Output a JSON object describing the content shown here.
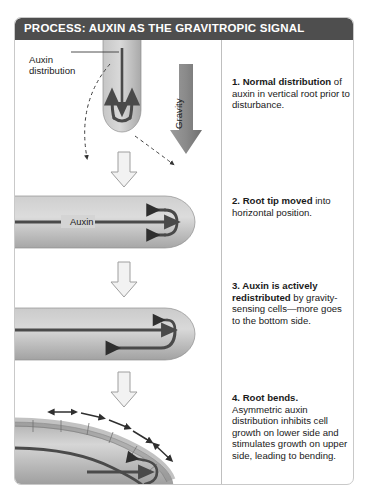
{
  "figure": {
    "title": "PROCESS: AUXIN AS THE GRAVITROPIC SIGNAL",
    "title_bar_color": "#4e4e4e",
    "border_color": "#c9c9c9",
    "background": "#ffffff"
  },
  "labels": {
    "auxin_distribution": "Auxin\ndistribution",
    "gravity": "Gravity",
    "auxin_inline": "Auxin"
  },
  "colors": {
    "root_fill_light": "#d8d8d8",
    "root_fill_mid": "#b5b5b5",
    "root_fill_dark": "#9a9a9a",
    "arrow_dark": "#4a4a4a",
    "gravity_arrow": "#8c8c8c",
    "transition_arrow_fill": "#f2f2f2",
    "transition_arrow_stroke": "#9e9e9e",
    "dashed_leader": "#3d3d3d",
    "text": "#1a1a1a"
  },
  "steps": [
    {
      "number": "1.",
      "heading": "Normal distribution",
      "body": " of auxin in vertical root prior to disturbance.",
      "stage": "vertical-root"
    },
    {
      "number": "2.",
      "heading": "Root tip moved",
      "body": " into horizontal position.",
      "stage": "horizontal-root"
    },
    {
      "number": "3.",
      "heading": "Auxin is actively redistributed",
      "body": " by gravity-sensing cells—more goes to the bottom side.",
      "stage": "redistributed-root"
    },
    {
      "number": "4.",
      "heading": "Root bends.",
      "body": " Asymmetric auxin distribution inhibits cell growth on lower side and stimulates growth on upper side, leading to bending.",
      "stage": "bending-root"
    }
  ],
  "diagram_elements": {
    "gravity_arrow": "downward-gray-arrow",
    "transition_arrows": [
      "white-down-arrow-1",
      "white-down-arrow-2",
      "white-down-arrow-3"
    ],
    "leader_lines": [
      "dashed-curve-left",
      "dashed-curve-right"
    ],
    "auxin_flow_arrows": "dark-recirculating-arrows",
    "growth_arrows": "double-headed-arrows-upper-surface"
  }
}
